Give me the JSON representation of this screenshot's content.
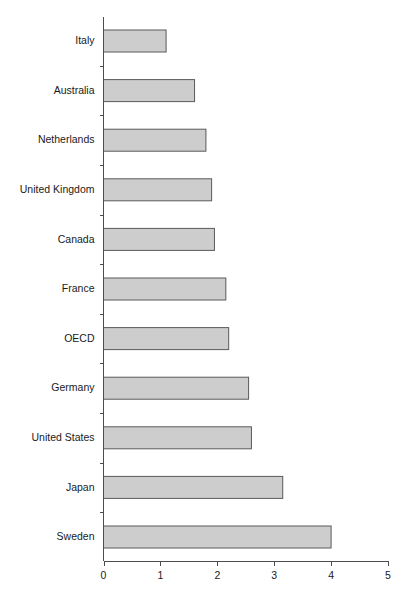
{
  "chart_data": {
    "type": "bar",
    "orientation": "horizontal",
    "title": "",
    "subtitle": "",
    "xlabel": "",
    "ylabel": "",
    "categories": [
      "Italy",
      "Australia",
      "Netherlands",
      "United Kingdom",
      "Canada",
      "France",
      "OECD",
      "Germany",
      "United States",
      "Japan",
      "Sweden"
    ],
    "values": [
      1.1,
      1.6,
      1.8,
      1.9,
      1.95,
      2.15,
      2.2,
      2.55,
      2.6,
      3.15,
      4.0
    ],
    "xlim": [
      0,
      5
    ],
    "xticks": [
      0,
      1,
      2,
      3,
      4,
      5
    ],
    "xtick_labels": [
      "0",
      "1",
      "2",
      "3",
      "4",
      "5"
    ],
    "grid": false,
    "legend": null,
    "bar_fill": "#cdcdcd",
    "bar_stroke": "#5a5a5a",
    "axis_color": "#4d4d4d",
    "text_color": "#1a1a1a",
    "background": "#ffffff"
  }
}
